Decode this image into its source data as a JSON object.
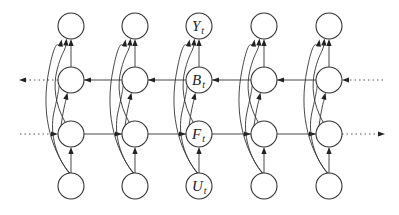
{
  "diagram": {
    "type": "bidirectional-recurrent-network",
    "columns": 5,
    "column_x": [
      71,
      135,
      199,
      264,
      329
    ],
    "row_y": {
      "Y": 26,
      "B": 80,
      "F": 134,
      "U": 186
    },
    "node_radius": 13,
    "labeled_column_index": 2,
    "labels": {
      "Y": {
        "main": "Y",
        "sub": "t"
      },
      "B": {
        "main": "B",
        "sub": "t"
      },
      "F": {
        "main": "F",
        "sub": "t"
      },
      "U": {
        "main": "U",
        "sub": "t"
      }
    },
    "rows": [
      {
        "id": "Y",
        "role": "output"
      },
      {
        "id": "B",
        "role": "backward-state",
        "direction": "right-to-left"
      },
      {
        "id": "F",
        "role": "forward-state",
        "direction": "left-to-right"
      },
      {
        "id": "U",
        "role": "input"
      }
    ],
    "edges_per_column": [
      "U->F",
      "F->B",
      "B->Y",
      "F->Y",
      "U->Y",
      "U->B"
    ],
    "continuation": {
      "B_row": "dotted arrows leaving left, entering from right",
      "F_row": "dotted arrows entering from left, leaving right"
    },
    "colors": {
      "stroke": "#333333",
      "background": "#ffffff"
    }
  }
}
